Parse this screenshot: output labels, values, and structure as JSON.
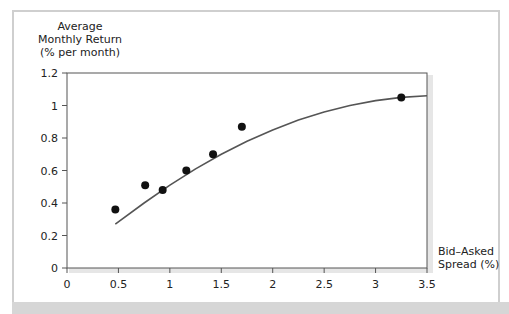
{
  "chart": {
    "y_axis_title_lines": [
      "Average",
      "Monthly Return",
      "(% per month)"
    ],
    "x_axis_title_lines": [
      "Bid–Asked",
      "Spread (%)"
    ]
  },
  "chart_data": {
    "type": "scatter",
    "title": "",
    "xlabel": "Bid–Asked Spread (%)",
    "ylabel": "Average Monthly Return (% per month)",
    "xlim": [
      0,
      3.5
    ],
    "ylim": [
      0,
      1.2
    ],
    "x_ticks": [
      "0",
      "0.5",
      "1",
      "1.5",
      "2",
      "2.5",
      "3",
      "3.5"
    ],
    "y_ticks": [
      "0",
      "0.2",
      "0.4",
      "0.6",
      "0.8",
      "1",
      "1.2"
    ],
    "grid": false,
    "legend": null,
    "series": [
      {
        "name": "Observed portfolios",
        "kind": "scatter",
        "x": [
          0.47,
          0.76,
          0.93,
          1.16,
          1.42,
          1.7,
          3.25
        ],
        "y": [
          0.36,
          0.51,
          0.48,
          0.6,
          0.7,
          0.87,
          1.05
        ]
      },
      {
        "name": "Fitted concave curve",
        "kind": "line",
        "x": [
          0.47,
          0.75,
          1.0,
          1.25,
          1.5,
          1.75,
          2.0,
          2.25,
          2.5,
          2.75,
          3.0,
          3.25,
          3.5
        ],
        "y": [
          0.27,
          0.4,
          0.51,
          0.61,
          0.7,
          0.78,
          0.85,
          0.91,
          0.96,
          1.0,
          1.03,
          1.05,
          1.06
        ]
      }
    ]
  }
}
